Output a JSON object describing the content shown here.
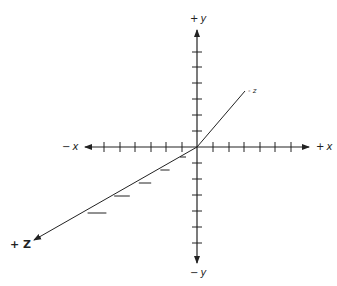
{
  "diagram": {
    "type": "3d-coordinate-axes",
    "origin": {
      "x": 197,
      "y": 147
    },
    "colors": {
      "axis": "#222222",
      "background": "#ffffff"
    },
    "axes": {
      "x": {
        "positive_label_sign": "+",
        "positive_label_var": "x",
        "negative_label_sign": "−",
        "negative_label_var": "x",
        "ticks_positive": [
          213,
          229,
          244,
          260,
          275,
          291
        ],
        "ticks_negative": [
          182,
          166,
          151,
          135,
          120,
          104
        ]
      },
      "y": {
        "positive_label_sign": "+",
        "positive_label_var": "y",
        "negative_label_sign": "−",
        "negative_label_var": "y",
        "ticks_positive": [
          131,
          115,
          99,
          83,
          67,
          52
        ],
        "ticks_negative": [
          163,
          179,
          195,
          211,
          227,
          243
        ]
      },
      "z": {
        "positive_label": "+ Z",
        "negative_label": "- z",
        "ticks_positive": [
          [
            183,
            157
          ],
          [
            165,
            170
          ],
          [
            145,
            183
          ],
          [
            122,
            196
          ],
          [
            97,
            213
          ]
        ]
      }
    }
  }
}
